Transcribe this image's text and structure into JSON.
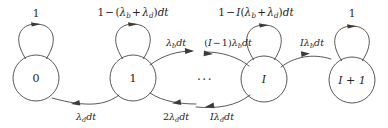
{
  "diagram": {
    "type": "state-transition-diagram",
    "stroke_color": "#3d3a38",
    "text_color": "#262322",
    "background_color": "#ffffff",
    "width": 388,
    "height": 128,
    "ellipsis": "···",
    "nodes": [
      {
        "id": "state-0",
        "label": "0",
        "italic": false,
        "cx": 36,
        "cy": 78,
        "r": 23
      },
      {
        "id": "state-1",
        "label": "1",
        "italic": false,
        "cx": 133,
        "cy": 78,
        "r": 23
      },
      {
        "id": "state-I",
        "label": "I",
        "italic": true,
        "cx": 264,
        "cy": 79,
        "r": 23
      },
      {
        "id": "state-I-1",
        "label": "I + 1",
        "italic": true,
        "cx": 352,
        "cy": 80,
        "r": 23
      }
    ],
    "self_loops": [
      {
        "id": "loop-state-0",
        "node": "state-0",
        "label_parts": [
          {
            "t": "1",
            "k": "mn"
          }
        ],
        "label_x": 36,
        "label_y": 13
      },
      {
        "id": "loop-state-1",
        "node": "state-1",
        "label_parts": [
          {
            "t": "1",
            "k": "mn"
          },
          {
            "t": "−",
            "k": "mo"
          },
          {
            "t": "(",
            "k": "mn"
          },
          {
            "t": "λ",
            "k": "mi"
          },
          {
            "t": "b",
            "k": "sub"
          },
          {
            "t": "+",
            "k": "mo"
          },
          {
            "t": "λ",
            "k": "mi"
          },
          {
            "t": "d",
            "k": "sub"
          },
          {
            "t": ")",
            "k": "mn"
          },
          {
            "t": "dt",
            "k": "mi"
          }
        ],
        "label_x": 133,
        "label_y": 13
      },
      {
        "id": "loop-state-I",
        "node": "state-I",
        "label_parts": [
          {
            "t": "1",
            "k": "mn"
          },
          {
            "t": "−",
            "k": "mo"
          },
          {
            "t": "I",
            "k": "mi"
          },
          {
            "t": "(",
            "k": "mn"
          },
          {
            "t": "λ",
            "k": "mi"
          },
          {
            "t": "b",
            "k": "sub"
          },
          {
            "t": "+",
            "k": "mo"
          },
          {
            "t": "λ",
            "k": "mi"
          },
          {
            "t": "d",
            "k": "sub"
          },
          {
            "t": ")",
            "k": "mn"
          },
          {
            "t": "dt",
            "k": "mi"
          }
        ],
        "label_x": 256,
        "label_y": 13
      },
      {
        "id": "loop-state-I-1",
        "node": "state-I-1",
        "label_parts": [
          {
            "t": "1",
            "k": "mn"
          }
        ],
        "label_x": 352,
        "label_y": 13
      }
    ],
    "forward_edges": [
      {
        "id": "edge-1-to-next",
        "from": "state-1",
        "to": "ellipsis",
        "direction": "right",
        "label_parts": [
          {
            "t": "λ",
            "k": "mi"
          },
          {
            "t": "b",
            "k": "sub"
          },
          {
            "t": "dt",
            "k": "mi"
          }
        ],
        "label_x": 176,
        "label_y": 44
      },
      {
        "id": "edge-prev-to-I",
        "from": "ellipsis",
        "to": "state-I",
        "direction": "right",
        "label_parts": [
          {
            "t": "(",
            "k": "mn"
          },
          {
            "t": "I",
            "k": "mi"
          },
          {
            "t": "−",
            "k": "mo"
          },
          {
            "t": "1",
            "k": "mn"
          },
          {
            "t": ")",
            "k": "mn"
          },
          {
            "t": "λ",
            "k": "mi"
          },
          {
            "t": "b",
            "k": "sub"
          },
          {
            "t": "dt",
            "k": "mi"
          }
        ],
        "label_x": 228,
        "label_y": 44
      },
      {
        "id": "edge-I-to-I-1",
        "from": "state-I",
        "to": "state-I-1",
        "direction": "right",
        "label_parts": [
          {
            "t": "I",
            "k": "mi"
          },
          {
            "t": "λ",
            "k": "mi"
          },
          {
            "t": "b",
            "k": "sub"
          },
          {
            "t": "dt",
            "k": "mi"
          }
        ],
        "label_x": 312,
        "label_y": 44
      }
    ],
    "backward_edges": [
      {
        "id": "edge-1-to-0",
        "from": "state-1",
        "to": "state-0",
        "direction": "left",
        "label_parts": [
          {
            "t": "λ",
            "k": "mi"
          },
          {
            "t": "d",
            "k": "sub"
          },
          {
            "t": "dt",
            "k": "mi"
          }
        ],
        "label_x": 86,
        "label_y": 118
      },
      {
        "id": "edge-next-to-1",
        "from": "ellipsis",
        "to": "state-1",
        "direction": "left",
        "label_parts": [
          {
            "t": "2",
            "k": "mn"
          },
          {
            "t": "λ",
            "k": "mi"
          },
          {
            "t": "d",
            "k": "sub"
          },
          {
            "t": "dt",
            "k": "mi"
          }
        ],
        "label_x": 176,
        "label_y": 118
      },
      {
        "id": "edge-I-to-prev",
        "from": "state-I",
        "to": "ellipsis",
        "direction": "left",
        "label_parts": [
          {
            "t": "I",
            "k": "mi"
          },
          {
            "t": "λ",
            "k": "mi"
          },
          {
            "t": "d",
            "k": "sub"
          },
          {
            "t": "dt",
            "k": "mi"
          }
        ],
        "label_x": 222,
        "label_y": 118
      }
    ],
    "ellipsis_position": {
      "x": 205,
      "y": 80
    }
  }
}
